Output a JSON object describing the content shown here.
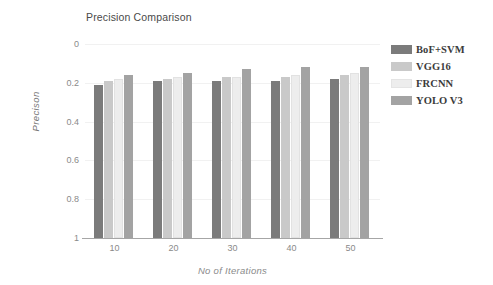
{
  "chart": {
    "title": "Precision Comparison",
    "xlabel": "No of Iterations",
    "ylabel": "Precison"
  },
  "legend": {
    "items": [
      {
        "label": "BoF+SVM",
        "color": "#7b7b7b",
        "swatch_name": "legend-swatch-bof-svm"
      },
      {
        "label": "VGG16",
        "color": "#c9c9c9",
        "swatch_name": "legend-swatch-vgg16"
      },
      {
        "label": "FRCNN",
        "color": "#ededed",
        "swatch_name": "legend-swatch-frcnn"
      },
      {
        "label": "YOLO V3",
        "color": "#a3a3a3",
        "swatch_name": "legend-swatch-yolo-v3"
      }
    ]
  },
  "y_ticks": [
    "1",
    "0.8",
    "0.6",
    "0.4",
    "0.2",
    "0"
  ],
  "x_ticks": [
    "10",
    "20",
    "30",
    "40",
    "50"
  ],
  "chart_data": {
    "type": "bar",
    "title": "Precision Comparison",
    "xlabel": "No of Iterations",
    "ylabel": "Precison",
    "categories": [
      "10",
      "20",
      "30",
      "40",
      "50"
    ],
    "ylim": [
      0,
      1
    ],
    "ytick_values": [
      0,
      0.2,
      0.4,
      0.6,
      0.8,
      1
    ],
    "grid": true,
    "legend_position": "right",
    "series": [
      {
        "name": "BoF+SVM",
        "color": "#7b7b7b",
        "values": [
          0.79,
          0.81,
          0.81,
          0.81,
          0.82
        ]
      },
      {
        "name": "VGG16",
        "color": "#c9c9c9",
        "values": [
          0.81,
          0.82,
          0.83,
          0.83,
          0.84
        ]
      },
      {
        "name": "FRCNN",
        "color": "#ededed",
        "values": [
          0.82,
          0.83,
          0.83,
          0.84,
          0.85
        ]
      },
      {
        "name": "YOLO V3",
        "color": "#a3a3a3",
        "values": [
          0.84,
          0.85,
          0.87,
          0.88,
          0.88
        ]
      }
    ]
  }
}
